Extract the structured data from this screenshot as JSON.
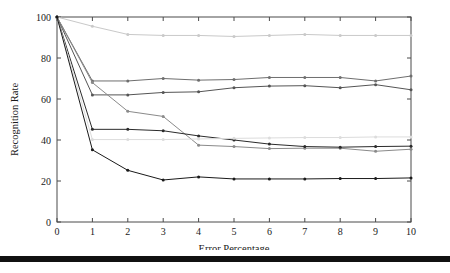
{
  "figure": {
    "background_color": "#ffffff",
    "bottom_rule_color": "#111111"
  },
  "chart_data": {
    "type": "line",
    "title": "",
    "subtitle": "",
    "xlabel": "Error Percentage",
    "ylabel": "Recognition Rate",
    "x": [
      0,
      1,
      2,
      3,
      4,
      5,
      6,
      7,
      8,
      9,
      10
    ],
    "xlim": [
      0,
      10
    ],
    "ylim": [
      0,
      100
    ],
    "xticks": [
      "0",
      "1",
      "2",
      "3",
      "4",
      "5",
      "6",
      "7",
      "8",
      "9",
      "10"
    ],
    "yticks": [
      "0",
      "20",
      "40",
      "60",
      "80",
      "100"
    ],
    "grid": false,
    "legend": "none",
    "legend_position": "none",
    "marker": "dot",
    "series": [
      {
        "name": "series-1",
        "color": "#c9c9c9",
        "values": [
          100,
          95.5,
          91.5,
          91,
          91,
          90.5,
          91,
          91.5,
          91,
          91,
          91
        ]
      },
      {
        "name": "series-2",
        "color": "#6e6e6e",
        "values": [
          100,
          68.8,
          68.8,
          70,
          69.2,
          69.5,
          70.5,
          70.5,
          70.5,
          68.8,
          71.2
        ]
      },
      {
        "name": "series-3",
        "color": "#555555",
        "values": [
          100,
          62,
          62,
          63.2,
          63.5,
          65.5,
          66.3,
          66.5,
          65.5,
          67,
          64.5
        ]
      },
      {
        "name": "series-4",
        "color": "#8a8a8a",
        "values": [
          100,
          68,
          54,
          51.5,
          37.5,
          36.8,
          35.8,
          36,
          36,
          34.5,
          35.5
        ]
      },
      {
        "name": "series-5",
        "color": "#2b2b2b",
        "values": [
          100,
          45.2,
          45.2,
          44.5,
          42,
          40,
          38,
          36.8,
          36.5,
          36.8,
          37
        ]
      },
      {
        "name": "series-6",
        "color": "#dcdcdc",
        "values": [
          100,
          40.2,
          40.2,
          40.2,
          40.5,
          40.8,
          41,
          41.2,
          41.2,
          41.5,
          41.5
        ]
      },
      {
        "name": "series-7",
        "color": "#1a1a1a",
        "values": [
          100,
          35.2,
          25.2,
          20.5,
          22,
          21,
          21,
          21,
          21.2,
          21.2,
          21.5
        ]
      }
    ]
  }
}
